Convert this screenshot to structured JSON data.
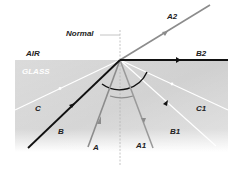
{
  "diagram": {
    "media": {
      "top": "AIR",
      "bottom": "GLASS"
    },
    "normal_label": "Normal",
    "rays": {
      "A": "A",
      "A1": "A1",
      "A2": "A2",
      "B": "B",
      "B1": "B1",
      "B2": "B2",
      "C": "C",
      "C1": "C1"
    },
    "colors": {
      "glass": "#c9c9c9",
      "ray_A": "#8c8c8c",
      "ray_B": "#111111",
      "ray_C": "#ffffff"
    }
  }
}
